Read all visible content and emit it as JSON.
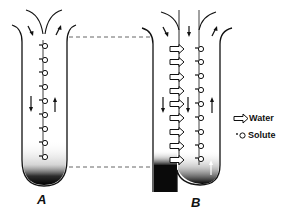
{
  "figure": {
    "panels": [
      {
        "id": "A",
        "label": "A",
        "description": "Single tube: solute diffuses along a concentration gradient, dense at bottom"
      },
      {
        "id": "B",
        "label": "B",
        "description": "Tube with central membrane: water arrows move across toward solute side"
      }
    ],
    "legend": [
      {
        "symbol": "hollow-arrow",
        "label": "Water"
      },
      {
        "symbol": "dot-circle",
        "label": "Solute"
      }
    ],
    "colors": {
      "ink": "#111111",
      "paper": "#ffffff",
      "dashed": "#555555"
    }
  }
}
